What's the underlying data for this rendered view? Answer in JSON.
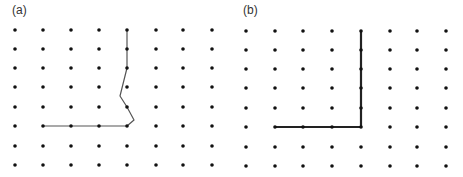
{
  "panels": [
    {
      "label": "(a)",
      "grid": {
        "xs": [
          15,
          43,
          71,
          99,
          127,
          156,
          183,
          212
        ],
        "ys": [
          30,
          49,
          68,
          87,
          107,
          126,
          146,
          165
        ]
      },
      "path": [
        [
          127,
          30
        ],
        [
          127,
          49
        ],
        [
          127,
          68
        ],
        [
          120,
          96
        ],
        [
          127,
          107
        ],
        [
          134,
          120
        ],
        [
          127,
          126
        ],
        [
          99,
          126
        ],
        [
          71,
          126
        ],
        [
          43,
          126
        ]
      ],
      "stroke_width": 1.2,
      "stroke": "#555555"
    },
    {
      "label": "(b)",
      "grid": {
        "xs": [
          246,
          275,
          303,
          332,
          361,
          390,
          417,
          446
        ],
        "ys": [
          31,
          50,
          69,
          88,
          108,
          127,
          147,
          166
        ]
      },
      "path": [
        [
          361,
          31
        ],
        [
          361,
          50
        ],
        [
          361,
          69
        ],
        [
          361,
          88
        ],
        [
          361,
          108
        ],
        [
          361,
          127
        ],
        [
          332,
          127
        ],
        [
          303,
          127
        ],
        [
          275,
          127
        ]
      ],
      "stroke_width": 2.2,
      "stroke": "#222222"
    }
  ],
  "dot_color": "#111111"
}
